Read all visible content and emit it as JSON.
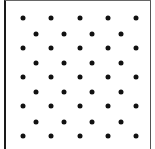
{
  "diagram": {
    "type": "staggered-dot-grid",
    "frame": {
      "border_color": "#1a1a1a",
      "background": "#ffffff"
    },
    "dot_color": "#111111",
    "rows": [
      {
        "index": 0,
        "y": 18,
        "xs": [
          23,
          51,
          80,
          108,
          136
        ]
      },
      {
        "index": 1,
        "y": 34,
        "xs": [
          36,
          64,
          92,
          121
        ]
      },
      {
        "index": 2,
        "y": 48,
        "xs": [
          23,
          51,
          80,
          108,
          136
        ]
      },
      {
        "index": 3,
        "y": 63,
        "xs": [
          36,
          64,
          92,
          121
        ]
      },
      {
        "index": 4,
        "y": 77,
        "xs": [
          23,
          51,
          80,
          108,
          136
        ]
      },
      {
        "index": 5,
        "y": 92,
        "xs": [
          36,
          64,
          92,
          121
        ]
      },
      {
        "index": 6,
        "y": 106,
        "xs": [
          23,
          51,
          80,
          108,
          136
        ]
      },
      {
        "index": 7,
        "y": 122,
        "xs": [
          36,
          64,
          92,
          121
        ]
      },
      {
        "index": 8,
        "y": 136,
        "xs": [
          23,
          51,
          80,
          108,
          136
        ]
      }
    ],
    "dot_count": 41
  }
}
